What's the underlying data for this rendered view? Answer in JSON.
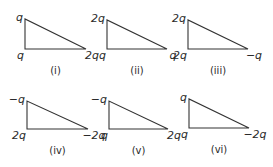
{
  "colors": {
    "stroke": "#333333",
    "text": "#2a2a2a",
    "background": "#ffffff"
  },
  "triangles": [
    {
      "caption": "(i)",
      "top": "q",
      "bottom_left": "q",
      "bottom_right": "2q",
      "pts": {
        "tx": 25,
        "ty": 19,
        "bx": 25,
        "by": 49,
        "rx": 86,
        "ry": 49
      }
    },
    {
      "caption": "(ii)",
      "top": "2q",
      "bottom_left": "q",
      "bottom_right": "q",
      "pts": {
        "tx": 107,
        "ty": 20,
        "bx": 107,
        "by": 49,
        "rx": 167,
        "ry": 49
      }
    },
    {
      "caption": "(iii)",
      "top": "2q",
      "bottom_left": "2q",
      "bottom_right": "−q",
      "pts": {
        "tx": 188,
        "ty": 20,
        "bx": 188,
        "by": 49,
        "rx": 248,
        "ry": 49
      }
    },
    {
      "caption": "(iv)",
      "top": "−q",
      "bottom_left": "2q",
      "bottom_right": "−2q",
      "pts": {
        "tx": 27,
        "ty": 101,
        "bx": 27,
        "by": 129,
        "rx": 88,
        "ry": 129
      }
    },
    {
      "caption": "(v)",
      "top": "−q",
      "bottom_left": "q",
      "bottom_right": "2q",
      "pts": {
        "tx": 109,
        "ty": 101,
        "bx": 109,
        "by": 129,
        "rx": 168,
        "ry": 129
      }
    },
    {
      "caption": "(vi)",
      "top": "q",
      "bottom_left": "q",
      "bottom_right": "−2q",
      "pts": {
        "tx": 189,
        "ty": 99,
        "bx": 189,
        "by": 128,
        "rx": 249,
        "ry": 128
      }
    }
  ]
}
